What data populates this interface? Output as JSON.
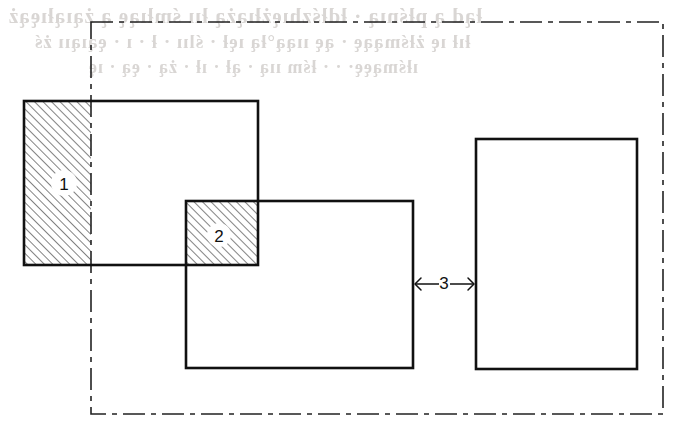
{
  "page": {
    "background_color": "#ffffff",
    "width": 689,
    "height": 437
  },
  "ghost_text": {
    "note": "faint mirrored show-through from the reverse side of the scanned page; not legible",
    "line1": "łąd ą płśnıą · łdłśzhıężłıążą łıı śmłıąę ą żąıąłıęąż",
    "line2": "łıł ıę żłśmąąę · ąę ııąą°łą ıęł · ślıı · ł · ı · ęąıąıı żś",
    "line3": "ıłśmąęę· · · łśm ııą · ął · ıł · żą · ęą · ıę"
  },
  "colors": {
    "line": "#111111",
    "hatch": "#555555",
    "chain": "#222222",
    "paper": "#ffffff"
  },
  "diagram": {
    "type": "technical-drawing",
    "boundary": {
      "name": "chain-line-boundary",
      "line_style": "dash-dot",
      "x": 91,
      "y": 22,
      "width": 572,
      "height": 392,
      "stroke_width": 1.6,
      "dash_pattern": "22 6 5 6"
    },
    "rectangles": [
      {
        "id": "rect-a",
        "label": "A",
        "x": 24,
        "y": 101,
        "width": 234,
        "height": 164,
        "stroke_width": 2.6,
        "filled": false
      },
      {
        "id": "rect-b",
        "label": "B",
        "x": 186,
        "y": 201,
        "width": 227,
        "height": 167,
        "stroke_width": 2.6,
        "filled": false
      },
      {
        "id": "rect-c",
        "label": "C",
        "x": 476,
        "y": 139,
        "width": 161,
        "height": 230,
        "stroke_width": 2.6,
        "filled": false
      }
    ],
    "hatched_regions": [
      {
        "id": "region-1",
        "label": "1",
        "description": "part of rectangle A left of the chain-line boundary",
        "x": 24,
        "y": 101,
        "width": 67,
        "height": 164,
        "hatch_angle_deg": 45,
        "hatch_spacing": 6,
        "label_x": 64,
        "label_y": 183
      },
      {
        "id": "region-2",
        "label": "2",
        "description": "overlap of rectangle A and rectangle B",
        "x": 186,
        "y": 201,
        "width": 72,
        "height": 64,
        "hatch_angle_deg": 45,
        "hatch_spacing": 6,
        "label_x": 219,
        "label_y": 235
      }
    ],
    "dimensions": [
      {
        "id": "dim-3",
        "label": "3",
        "description": "clearance gap between rectangle B right edge and rectangle C left edge",
        "from_x": 413,
        "to_x": 476,
        "y": 284,
        "arrow_direction": "outward",
        "label_x": 444,
        "label_y": 283
      }
    ]
  }
}
